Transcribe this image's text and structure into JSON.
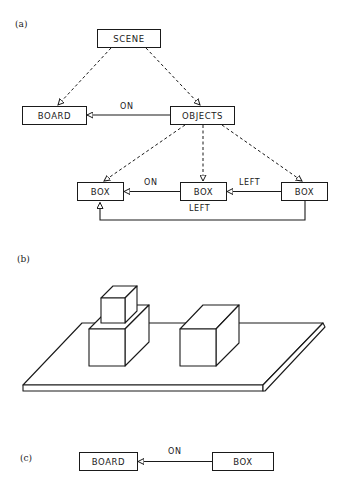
{
  "figure": {
    "panels": {
      "a": {
        "label": "(a)",
        "nodes": {
          "scene": "SCENE",
          "board": "BOARD",
          "objects": "OBJECTS",
          "box_left": "BOX",
          "box_middle": "BOX",
          "box_right": "BOX"
        },
        "edges": {
          "objects_board": "ON",
          "box_middle_box_left": "ON",
          "box_right_box_middle": "LEFT",
          "box_right_box_left": "LEFT"
        }
      },
      "b": {
        "label": "(b)",
        "description": "Line drawing: a board with a small block stacked on a large block and a separate rectangular block"
      },
      "c": {
        "label": "(c)",
        "nodes": {
          "board": "BOARD",
          "box": "BOX"
        },
        "edges": {
          "box_board": "ON"
        }
      }
    }
  }
}
